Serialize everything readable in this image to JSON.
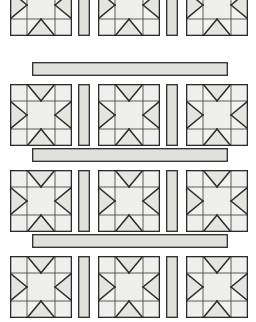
{
  "document": {
    "kind": "quilt-pattern-illustration",
    "title": "Sawtooth Star Quilt Layout",
    "block_name": "Sawtooth Star",
    "page_background": "#ffffff"
  },
  "palette": {
    "paper": "#ffffff",
    "block_background": "#f2f2f0",
    "corner_square_fill": "#efefed",
    "center_square_fill": "#eeeeec",
    "star_point_fill": "#e4e4e1",
    "sashing_fill": "#e0e0dd",
    "outline": "#2b2b2b",
    "inner_line": "#4a4a4a",
    "scan_speckle": "#d9d9d6"
  },
  "layout": {
    "canvas_width": 256,
    "canvas_height": 322,
    "rows": 4,
    "blocks_per_row": 3,
    "block_size": 62,
    "vertical_sash_width": 12,
    "horizontal_sash_height": 14,
    "row_tops": [
      -26,
      84,
      170,
      256
    ],
    "block_lefts": [
      10,
      98,
      186
    ],
    "vertical_sash_lefts": [
      78,
      166
    ],
    "horizontal_sash": {
      "left": 32,
      "right": 228,
      "tops": [
        62,
        148,
        234
      ]
    },
    "block_grid_fractions": [
      0.0,
      0.27,
      0.73,
      1.0
    ]
  },
  "block": {
    "name": "Sawtooth Star",
    "structure": "3x3 grid: four plain corner squares, four flying-geese star-point units on the edges, one plain center square",
    "cells": [
      {
        "position": "top-left",
        "type": "plain-square"
      },
      {
        "position": "top-center",
        "type": "flying-geese-down"
      },
      {
        "position": "top-right",
        "type": "plain-square"
      },
      {
        "position": "middle-left",
        "type": "flying-geese-right"
      },
      {
        "position": "middle-center",
        "type": "plain-square"
      },
      {
        "position": "middle-right",
        "type": "flying-geese-left"
      },
      {
        "position": "bottom-left",
        "type": "plain-square"
      },
      {
        "position": "bottom-center",
        "type": "flying-geese-up"
      },
      {
        "position": "bottom-right",
        "type": "plain-square"
      }
    ]
  },
  "rows": [
    {
      "id": "row-1",
      "label": "Block Row 1",
      "cropped": "top"
    },
    {
      "id": "row-2",
      "label": "Block Row 2",
      "cropped": "none"
    },
    {
      "id": "row-3",
      "label": "Block Row 3",
      "cropped": "none"
    },
    {
      "id": "row-4",
      "label": "Block Row 4",
      "cropped": "bottom"
    }
  ],
  "sashing": [
    {
      "id": "sash-h-1",
      "label": "Horizontal Sashing Strip 1"
    },
    {
      "id": "sash-h-2",
      "label": "Horizontal Sashing Strip 2"
    },
    {
      "id": "sash-h-3",
      "label": "Horizontal Sashing Strip 3"
    }
  ]
}
